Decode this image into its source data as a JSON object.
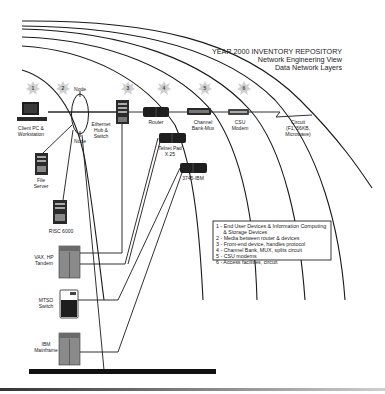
{
  "title": {
    "line1": "YEAR 2000 INVENTORY REPOSITORY",
    "line2": "Network Engineering View",
    "line3": "Data Network Layers"
  },
  "layer_badges": [
    {
      "num": "1",
      "x": 33,
      "y": 88
    },
    {
      "num": "2",
      "x": 63,
      "y": 88
    },
    {
      "num": "3",
      "x": 128,
      "y": 88
    },
    {
      "num": "4",
      "x": 164,
      "y": 88
    },
    {
      "num": "5",
      "x": 205,
      "y": 88
    },
    {
      "num": "6",
      "x": 244,
      "y": 88
    }
  ],
  "devices": {
    "client_pc": {
      "line1": "Client PC &",
      "line2": "Workstation"
    },
    "node_top": "Node",
    "node_bottom": "Node",
    "ethernet_hub": {
      "line1": "Ethernet",
      "line2": "Hub &",
      "line3": "Switch"
    },
    "router": "Router",
    "channel_bank": {
      "line1": "Channel",
      "line2": "Bank-Mux"
    },
    "csu_modem": {
      "line1": "CSU",
      "line2": "Modem"
    },
    "circuit": {
      "line1": "Circuit",
      "line2": "(F1, 56KB,",
      "line3": "Microwave)"
    },
    "telnet_pad": {
      "line1": "Telnet Pad",
      "line2": "X.25"
    },
    "ibm_3745": "3745-IBM",
    "file_server": {
      "line1": "File",
      "line2": "Server"
    },
    "risc": "RISC 6000",
    "vax": {
      "line1": "VAX, HP",
      "line2": "Tandem"
    },
    "mtso": {
      "line1": "MTSO",
      "line2": "Switch"
    },
    "mainframe": {
      "line1": "IBM",
      "line2": "Mainframe"
    }
  },
  "legend": [
    "1 - End User Devices & Information Computing",
    "     & Storage Devices",
    "2 - Media between router & devices",
    "3 - Front-end device, handles protocol",
    "4 - Channel Bank, MUX, splits circuit",
    "5 - CSU modems",
    "6 - Access facilities, circuit"
  ],
  "colors": {
    "line": "#1a1a1a",
    "badge": "#cfcfcf",
    "device_dark": "#1e1e1e",
    "device_gray": "#8a8a8a"
  }
}
